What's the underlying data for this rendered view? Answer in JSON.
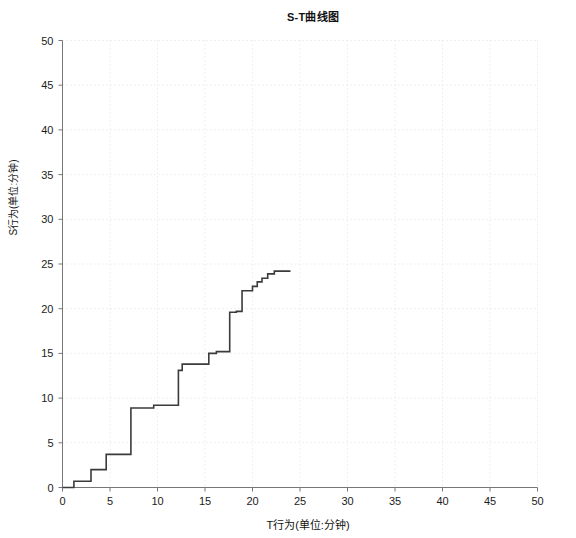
{
  "chart_data": {
    "type": "line",
    "title": "S-T曲线图",
    "xlabel": "T行为(单位:分钟)",
    "ylabel": "S行为(单位:分钟)",
    "xlim": [
      0,
      50
    ],
    "ylim": [
      0,
      50
    ],
    "xticks": [
      0,
      5,
      10,
      15,
      20,
      25,
      30,
      35,
      40,
      45,
      50
    ],
    "yticks": [
      0,
      5,
      10,
      15,
      20,
      25,
      30,
      35,
      40,
      45,
      50
    ],
    "xtick_labels": [
      "0",
      "5",
      "10",
      "15",
      "20",
      "25",
      "30",
      "35",
      "40",
      "45",
      "50"
    ],
    "ytick_labels": [
      "0",
      "5",
      "10",
      "15",
      "20",
      "25",
      "30",
      "35",
      "40",
      "45",
      "50"
    ],
    "grid": true,
    "grid_style": "dotted",
    "legend": null,
    "line_color": "#3b3b3b",
    "line_width": 1.6,
    "interpolation": "step-after",
    "series": [
      {
        "name": "S-T",
        "x": [
          0.0,
          1.2,
          1.2,
          3.0,
          3.0,
          4.6,
          4.6,
          7.2,
          7.2,
          9.6,
          9.6,
          12.2,
          12.2,
          12.6,
          12.6,
          15.4,
          15.4,
          16.2,
          16.2,
          17.6,
          17.6,
          18.3,
          18.3,
          18.9,
          18.9,
          20.0,
          20.0,
          20.5,
          20.5,
          21.0,
          21.0,
          21.6,
          21.6,
          22.3,
          22.3,
          24.0
        ],
        "y": [
          0.0,
          0.0,
          0.7,
          0.7,
          2.0,
          2.0,
          3.7,
          3.7,
          8.9,
          8.9,
          9.2,
          9.2,
          13.1,
          13.1,
          13.8,
          13.8,
          15.0,
          15.0,
          15.2,
          15.2,
          19.6,
          19.6,
          19.7,
          19.7,
          22.0,
          22.0,
          22.5,
          22.5,
          23.0,
          23.0,
          23.4,
          23.4,
          23.9,
          23.9,
          24.2,
          24.2
        ]
      }
    ]
  }
}
